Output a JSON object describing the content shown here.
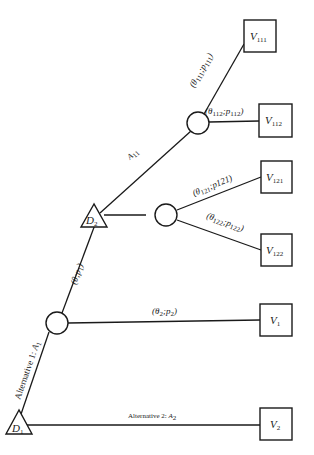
{
  "diagram": {
    "type": "decision-tree",
    "colors": {
      "stroke": "#1a1a1a",
      "background": "#ffffff"
    },
    "decision_nodes": [
      {
        "id": "D1",
        "main": "D",
        "sub": "1"
      },
      {
        "id": "D2",
        "main": "D",
        "sub": "2"
      }
    ],
    "chance_nodes": [
      "C1",
      "C11",
      "C12"
    ],
    "terminals": [
      {
        "id": "V111",
        "main": "V",
        "sub": "111"
      },
      {
        "id": "V112",
        "main": "V",
        "sub": "112"
      },
      {
        "id": "V121",
        "main": "V",
        "sub": "121"
      },
      {
        "id": "V122",
        "main": "V",
        "sub": "122"
      },
      {
        "id": "V1",
        "main": "V",
        "sub": "1"
      },
      {
        "id": "V2",
        "main": "V",
        "sub": "2"
      }
    ],
    "edges": {
      "alt1": {
        "prefix": "Alternative 1: ",
        "main": "A",
        "sub": "1"
      },
      "alt2": {
        "prefix": "Alternative 2: ",
        "main": "A",
        "sub": "2"
      },
      "theta_p1": {
        "open": "(",
        "theta": "θ",
        "sep": ";",
        "p": "p",
        "psub": "1",
        "close": ")"
      },
      "a11": {
        "main": "A",
        "sub": "11"
      },
      "theta2": {
        "open": "(",
        "theta": "θ",
        "tsub": "2",
        "sep": ";",
        "p": "p",
        "psub": "2",
        "close": ")"
      },
      "theta111": {
        "open": "(",
        "theta": "θ",
        "tsub": "111",
        "sep": ";",
        "p": "p",
        "psub": "111",
        "close": ")"
      },
      "theta112": {
        "open": "(",
        "theta": "θ",
        "tsub": "112",
        "sep": ";",
        "p": "p",
        "psub": "112",
        "close": ")"
      },
      "theta121": {
        "open": "(",
        "theta": "θ",
        "tsub": "121",
        "sep": ";",
        "p": "p121",
        "close": ")"
      },
      "theta122": {
        "open": "(",
        "theta": "θ",
        "tsub": "122",
        "sep": ";",
        "p": "p",
        "psub": "122",
        "close": ")"
      }
    }
  }
}
